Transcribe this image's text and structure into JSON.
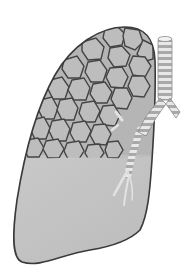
{
  "figure": {
    "style": "grayscale",
    "colors": {
      "background": "#ffffff",
      "lung_fill": "#bdbdbd",
      "lung_lower_fill": "#c4c4c4",
      "outline": "#3a3a3a",
      "alveoli_fill": "#b8b8b8",
      "alveoli_stroke": "#444444",
      "trachea_light": "#e6e6e6",
      "trachea_dark": "#a8a8a8"
    }
  }
}
